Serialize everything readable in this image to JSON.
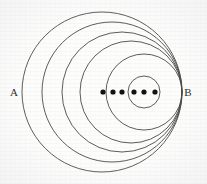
{
  "figure": {
    "background_color": "#fdfdfc",
    "stroke_color": "#4a4a4a",
    "dot_color": "#111111",
    "labels": {
      "left": "A",
      "right": "B"
    },
    "label_positions": {
      "left": {
        "x": 14,
        "y": 96
      },
      "right": {
        "x": 188,
        "y": 96
      }
    },
    "axis": {
      "y": 92,
      "x_start": 22,
      "x_end": 182
    },
    "circles": [
      {
        "name": "circle-1-outermost",
        "cx": 102,
        "cy": 92,
        "r": 80,
        "stroke_width": 0.9
      },
      {
        "name": "circle-2",
        "cx": 112,
        "cy": 92,
        "r": 70,
        "stroke_width": 0.9
      },
      {
        "name": "circle-3",
        "cx": 122,
        "cy": 92,
        "r": 60,
        "stroke_width": 0.9
      },
      {
        "name": "circle-4",
        "cx": 131,
        "cy": 92,
        "r": 51,
        "stroke_width": 0.9
      },
      {
        "name": "circle-5-innermost",
        "cx": 144,
        "cy": 92,
        "r": 38,
        "stroke_width": 0.9
      },
      {
        "name": "circle-6-small",
        "cx": 144,
        "cy": 92,
        "r": 16,
        "stroke_width": 0.9
      }
    ],
    "dots": [
      {
        "name": "dot-1",
        "cx": 103,
        "cy": 92,
        "r": 2.6
      },
      {
        "name": "dot-2",
        "cx": 113,
        "cy": 92,
        "r": 2.6
      },
      {
        "name": "dot-3",
        "cx": 122,
        "cy": 92,
        "r": 2.6
      },
      {
        "name": "dot-4",
        "cx": 134,
        "cy": 92,
        "r": 2.6
      },
      {
        "name": "dot-5",
        "cx": 144,
        "cy": 92,
        "r": 2.6
      },
      {
        "name": "dot-6",
        "cx": 155,
        "cy": 92,
        "r": 2.6
      }
    ],
    "chart_data": {
      "type": "diagram",
      "description": "Nested (coaxial) circles all internally tangent near the right point B; centers and additional marked points lie on the horizontal line AB.",
      "circle_count": 6,
      "dot_count": 6,
      "tangent_point_label": "B",
      "far_point_label": "A"
    }
  }
}
